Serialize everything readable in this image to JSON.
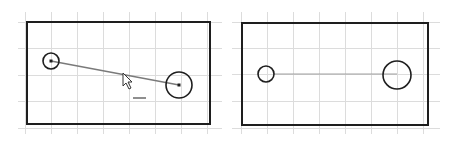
{
  "colors": {
    "background": "#ffffff",
    "grid": "#dcdcdc",
    "outline": "#1e1e1e",
    "connector": "#7a7a7a",
    "connector_right": "#a0a0a0"
  },
  "panels": [
    {
      "name": "left-panel-before",
      "rect": {
        "x": 27,
        "y": 22,
        "w": 183,
        "h": 102
      },
      "grid": {
        "xs": [
          25,
          51,
          77,
          103,
          129,
          155,
          181,
          207
        ],
        "ys": [
          22,
          48,
          75,
          101,
          128
        ],
        "x0": 18,
        "x1": 222,
        "y0": 12,
        "y1": 134
      },
      "small_circle": {
        "cx": 51,
        "cy": 61,
        "r": 8
      },
      "large_circle": {
        "cx": 179,
        "cy": 85,
        "r": 13
      },
      "connector": {
        "x1": 51,
        "y1": 61,
        "x2": 179,
        "y2": 85
      },
      "cursor": {
        "x": 123,
        "y": 73
      },
      "underscore": {
        "x1": 133,
        "x2": 146,
        "y": 98
      }
    },
    {
      "name": "right-panel-after",
      "rect": {
        "x": 242,
        "y": 23,
        "w": 186,
        "h": 102
      },
      "grid": {
        "xs": [
          241,
          267,
          293,
          319,
          345,
          371,
          397,
          423
        ],
        "ys": [
          22,
          48,
          74,
          101,
          128
        ],
        "x0": 232,
        "x1": 440,
        "y0": 12,
        "y1": 134
      },
      "small_circle": {
        "cx": 266,
        "cy": 74,
        "r": 8
      },
      "large_circle": {
        "cx": 397,
        "cy": 75,
        "r": 14
      },
      "connector": {
        "x1": 274,
        "y1": 74,
        "x2": 397,
        "y2": 74
      }
    }
  ]
}
